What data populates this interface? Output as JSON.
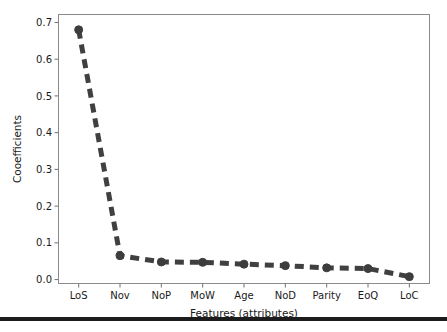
{
  "figure": {
    "background_color": "#ffffff",
    "frame_color": "#8a8a8a",
    "bottom_rule_color": "#1c1c1c"
  },
  "chart_data": {
    "type": "line",
    "title": "",
    "xlabel": "Features (attributes)",
    "ylabel": "Cooefficients",
    "categories": [
      "LoS",
      "Nov",
      "NoP",
      "MoW",
      "Age",
      "NoD",
      "Parity",
      "EoQ",
      "LoC"
    ],
    "values": [
      0.68,
      0.065,
      0.048,
      0.047,
      0.042,
      0.038,
      0.032,
      0.03,
      0.008
    ],
    "series": [
      {
        "name": "Coefficients",
        "values": [
          0.68,
          0.065,
          0.048,
          0.047,
          0.042,
          0.038,
          0.032,
          0.03,
          0.008
        ]
      }
    ],
    "ylim": [
      -0.012,
      0.723
    ],
    "yticks": [
      0.0,
      0.1,
      0.2,
      0.3,
      0.4,
      0.5,
      0.6,
      0.7
    ],
    "ytick_labels": [
      "0.0",
      "0.1",
      "0.2",
      "0.3",
      "0.4",
      "0.5",
      "0.6",
      "0.7"
    ],
    "xtick_labels": [
      "LoS",
      "Nov",
      "NoP",
      "MoW",
      "Age",
      "NoD",
      "Parity",
      "EoQ",
      "LoC"
    ],
    "grid": false,
    "legend": null,
    "line_style": "dashed",
    "line_color": "#404040",
    "line_width": 5,
    "dash_pattern": "9 6",
    "marker": "circle",
    "marker_color": "#3d3d3d",
    "marker_size": 4
  }
}
